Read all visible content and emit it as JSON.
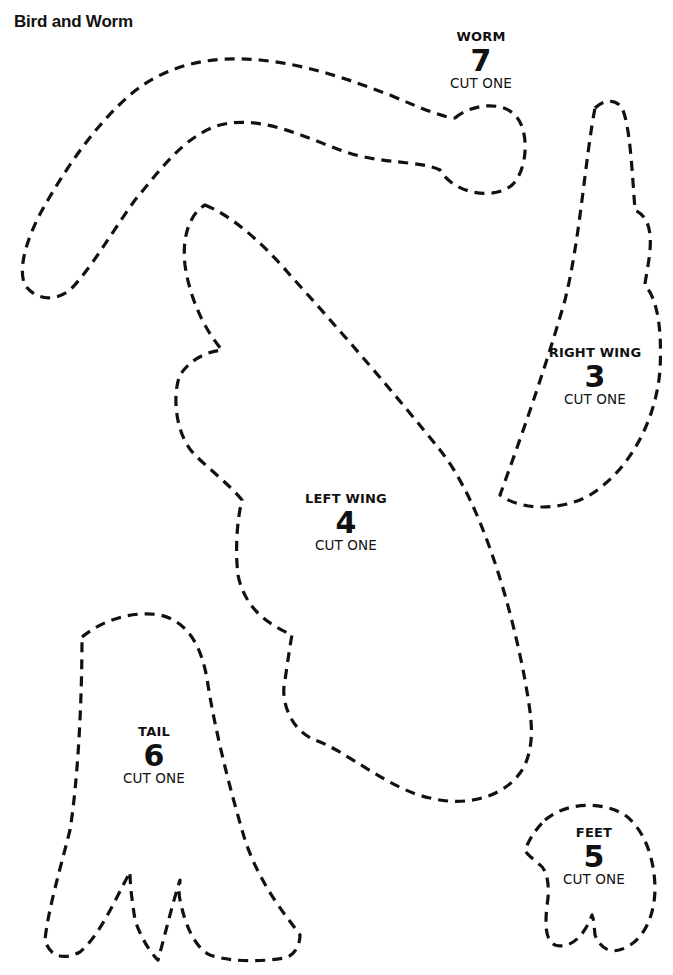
{
  "document": {
    "title": "Bird and Worm"
  },
  "pieces": [
    {
      "id": "worm",
      "name": "WORM",
      "number": "7",
      "instruction": "CUT ONE"
    },
    {
      "id": "right-wing",
      "name": "RIGHT WING",
      "number": "3",
      "instruction": "CUT ONE"
    },
    {
      "id": "left-wing",
      "name": "LEFT WING",
      "number": "4",
      "instruction": "CUT ONE"
    },
    {
      "id": "tail",
      "name": "TAIL",
      "number": "6",
      "instruction": "CUT ONE"
    },
    {
      "id": "feet",
      "name": "FEET",
      "number": "5",
      "instruction": "CUT ONE"
    }
  ],
  "style": {
    "outline_color": "#111111",
    "background_color": "#ffffff",
    "outline_style": "dashed"
  }
}
